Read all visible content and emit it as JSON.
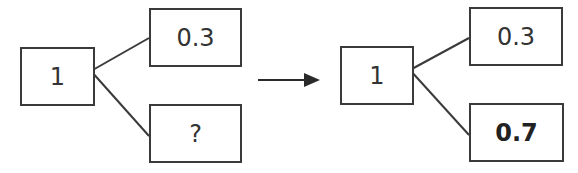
{
  "diagram": {
    "type": "probability-tree",
    "colors": {
      "stroke": "#3a3a3a",
      "text": "#333333",
      "background": "#ffffff"
    },
    "before": {
      "root": {
        "label": "1"
      },
      "branches": [
        {
          "label": "0.3"
        },
        {
          "label": "?"
        }
      ]
    },
    "transition": {
      "icon": "right-arrow"
    },
    "after": {
      "root": {
        "label": "1"
      },
      "branches": [
        {
          "label": "0.3"
        },
        {
          "label": "0.7",
          "emphasis": "bold"
        }
      ]
    }
  }
}
